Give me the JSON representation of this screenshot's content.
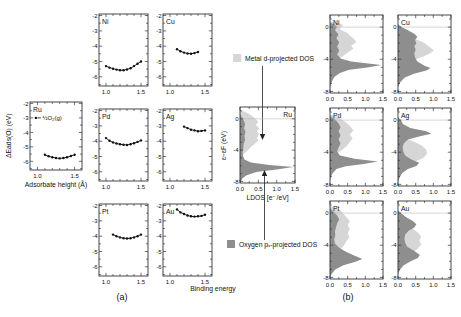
{
  "chart_data": {
    "curve_axis": {
      "xrange": [
        0.9,
        1.6
      ],
      "yrange": [
        -6.6,
        -1.9
      ],
      "xticks": [
        1.0,
        1.5
      ],
      "xminor": [
        1.1,
        1.2,
        1.3,
        1.4
      ],
      "yticks": [
        -2,
        -3,
        -4,
        -5,
        -6
      ],
      "yminor": [
        -2.5,
        -3.5,
        -4.5,
        -5.5,
        -6.5
      ],
      "grid": false
    },
    "dos_axis": {
      "xrange": [
        0,
        1.5
      ],
      "yrange": [
        -8.2,
        1.5
      ],
      "xticks": [
        0,
        0.5,
        1.0,
        1.5
      ],
      "xminor": [
        0.25,
        0.75,
        1.25
      ],
      "yticks": [
        0,
        -4,
        -8
      ],
      "yminor": [
        1,
        -1,
        -2,
        -3,
        -5,
        -6,
        -7
      ],
      "fermi_level": 0,
      "grid": false
    },
    "ru_curve": {
      "type": "line",
      "title": "Ru",
      "xlabel": "Adsorbate height (Å)",
      "ylabel": "ΔEads(O) (eV)",
      "annotation": {
        "text": "½O₂(g)",
        "x": 0.98,
        "y": -3.0
      },
      "x": [
        1.1,
        1.15,
        1.2,
        1.25,
        1.3,
        1.35,
        1.4,
        1.45,
        1.5
      ],
      "y": [
        -5.55,
        -5.65,
        -5.72,
        -5.77,
        -5.8,
        -5.77,
        -5.72,
        -5.63,
        -5.55
      ]
    },
    "panel_a_plots": [
      {
        "type": "line",
        "title": "Ni",
        "x": [
          1.0,
          1.05,
          1.1,
          1.15,
          1.2,
          1.25,
          1.3,
          1.35,
          1.4,
          1.45,
          1.5
        ],
        "y": [
          -5.3,
          -5.4,
          -5.47,
          -5.53,
          -5.57,
          -5.57,
          -5.52,
          -5.44,
          -5.3,
          -5.15,
          -5.0
        ]
      },
      {
        "type": "line",
        "title": "Cu",
        "x": [
          1.1,
          1.15,
          1.2,
          1.25,
          1.3,
          1.35,
          1.4
        ],
        "y": [
          -4.2,
          -4.33,
          -4.42,
          -4.48,
          -4.5,
          -4.45,
          -4.38
        ]
      },
      {
        "type": "line",
        "title": "Pd",
        "x": [
          1.0,
          1.05,
          1.1,
          1.15,
          1.2,
          1.25,
          1.3,
          1.35,
          1.4,
          1.45,
          1.5
        ],
        "y": [
          -3.8,
          -3.97,
          -4.08,
          -4.15,
          -4.2,
          -4.23,
          -4.25,
          -4.2,
          -4.13,
          -4.05,
          -3.95
        ]
      },
      {
        "type": "line",
        "title": "Ag",
        "x": [
          1.2,
          1.25,
          1.3,
          1.35,
          1.4,
          1.45,
          1.5
        ],
        "y": [
          -3.05,
          -3.15,
          -3.25,
          -3.3,
          -3.35,
          -3.33,
          -3.3
        ]
      },
      {
        "type": "line",
        "title": "Pt",
        "x": [
          1.1,
          1.15,
          1.2,
          1.25,
          1.3,
          1.35,
          1.4,
          1.45,
          1.5
        ],
        "y": [
          -3.9,
          -4.0,
          -4.08,
          -4.13,
          -4.15,
          -4.13,
          -4.08,
          -4.0,
          -3.9
        ]
      },
      {
        "type": "line",
        "title": "Au",
        "x": [
          1.1,
          1.15,
          1.2,
          1.25,
          1.3,
          1.35,
          1.4,
          1.45,
          1.5
        ],
        "y": [
          -2.25,
          -2.45,
          -2.55,
          -2.65,
          -2.7,
          -2.72,
          -2.7,
          -2.68,
          -2.6
        ]
      }
    ],
    "center_dos": {
      "type": "area",
      "title": "Ru",
      "xlabel": "LDOS [e⁻/eV]",
      "ylabel": "ε−εF (eV)",
      "metal_d": [
        [
          1.2,
          0
        ],
        [
          0.9,
          0.12
        ],
        [
          0.6,
          0.25
        ],
        [
          0.3,
          0.35
        ],
        [
          0,
          0.42
        ],
        [
          -0.4,
          0.5
        ],
        [
          -0.8,
          0.43
        ],
        [
          -1.2,
          0.53
        ],
        [
          -1.6,
          0.46
        ],
        [
          -2,
          0.52
        ],
        [
          -2.4,
          0.46
        ],
        [
          -2.8,
          0.5
        ],
        [
          -3.2,
          0.4
        ],
        [
          -3.6,
          0.3
        ],
        [
          -4,
          0.22
        ],
        [
          -4.4,
          0.12
        ],
        [
          -4.8,
          0.05
        ],
        [
          -5.2,
          0
        ]
      ],
      "oxygen_p": [
        [
          0.6,
          0
        ],
        [
          0.2,
          0.05
        ],
        [
          -0.2,
          0.1
        ],
        [
          -0.7,
          0.14
        ],
        [
          -1.2,
          0.11
        ],
        [
          -1.7,
          0.15
        ],
        [
          -2.2,
          0.12
        ],
        [
          -2.7,
          0.14
        ],
        [
          -3.2,
          0.1
        ],
        [
          -3.7,
          0.09
        ],
        [
          -4.2,
          0.07
        ],
        [
          -4.7,
          0.08
        ],
        [
          -5.2,
          0.12
        ],
        [
          -5.6,
          0.3
        ],
        [
          -5.9,
          0.8
        ],
        [
          -6.15,
          1.45
        ],
        [
          -6.45,
          1.05
        ],
        [
          -6.8,
          0.45
        ],
        [
          -7.2,
          0.18
        ],
        [
          -7.6,
          0.07
        ],
        [
          -8,
          0.02
        ],
        [
          -8.2,
          0
        ]
      ]
    },
    "panel_b_plots": [
      {
        "type": "area",
        "title": "Ni",
        "metal_d": [
          [
            0.7,
            0
          ],
          [
            0.45,
            0.28
          ],
          [
            0.2,
            0.38
          ],
          [
            0,
            0.32
          ],
          [
            -0.3,
            0.28
          ],
          [
            -0.7,
            0.48
          ],
          [
            -1.1,
            0.58
          ],
          [
            -1.5,
            0.68
          ],
          [
            -1.9,
            0.75
          ],
          [
            -2.3,
            0.6
          ],
          [
            -2.7,
            0.66
          ],
          [
            -3.1,
            0.52
          ],
          [
            -3.5,
            0.4
          ],
          [
            -3.9,
            0.26
          ],
          [
            -4.3,
            0.12
          ],
          [
            -4.7,
            0
          ]
        ],
        "oxygen_p": [
          [
            0.55,
            0
          ],
          [
            0.3,
            0.12
          ],
          [
            0,
            0.2
          ],
          [
            -0.4,
            0.14
          ],
          [
            -0.9,
            0.24
          ],
          [
            -1.4,
            0.18
          ],
          [
            -1.9,
            0.26
          ],
          [
            -2.4,
            0.2
          ],
          [
            -2.9,
            0.26
          ],
          [
            -3.4,
            0.2
          ],
          [
            -3.9,
            0.3
          ],
          [
            -4.3,
            0.6
          ],
          [
            -4.7,
            1.45
          ],
          [
            -5,
            1.1
          ],
          [
            -5.3,
            0.55
          ],
          [
            -5.7,
            0.28
          ],
          [
            -6.2,
            0.12
          ],
          [
            -6.8,
            0.05
          ],
          [
            -7.4,
            0.01
          ],
          [
            -7.8,
            0
          ]
        ]
      },
      {
        "type": "area",
        "title": "Cu",
        "metal_d": [
          [
            0.35,
            0
          ],
          [
            0,
            0.08
          ],
          [
            -0.5,
            0.12
          ],
          [
            -1,
            0.22
          ],
          [
            -1.5,
            0.5
          ],
          [
            -2,
            0.75
          ],
          [
            -2.5,
            0.9
          ],
          [
            -2.9,
            1.02
          ],
          [
            -3.3,
            0.9
          ],
          [
            -3.7,
            0.7
          ],
          [
            -4.1,
            0.45
          ],
          [
            -4.5,
            0.18
          ],
          [
            -4.9,
            0.05
          ],
          [
            -5.3,
            0
          ]
        ],
        "oxygen_p": [
          [
            0.35,
            0
          ],
          [
            0,
            0.1
          ],
          [
            -0.4,
            0.28
          ],
          [
            -0.8,
            0.45
          ],
          [
            -1.2,
            0.55
          ],
          [
            -1.6,
            0.48
          ],
          [
            -2,
            0.52
          ],
          [
            -2.4,
            0.46
          ],
          [
            -2.8,
            0.5
          ],
          [
            -3.3,
            0.46
          ],
          [
            -3.8,
            0.48
          ],
          [
            -4.3,
            0.55
          ],
          [
            -4.8,
            0.75
          ],
          [
            -5.1,
            0.92
          ],
          [
            -5.4,
            0.8
          ],
          [
            -5.8,
            0.45
          ],
          [
            -6.3,
            0.18
          ],
          [
            -6.9,
            0.06
          ],
          [
            -7.5,
            0
          ]
        ]
      },
      {
        "type": "area",
        "title": "Pd",
        "metal_d": [
          [
            0.7,
            0
          ],
          [
            0.4,
            0.2
          ],
          [
            0.1,
            0.32
          ],
          [
            -0.3,
            0.45
          ],
          [
            -0.8,
            0.58
          ],
          [
            -1.3,
            0.66
          ],
          [
            -1.8,
            0.56
          ],
          [
            -2.3,
            0.64
          ],
          [
            -2.8,
            0.55
          ],
          [
            -3.3,
            0.46
          ],
          [
            -3.8,
            0.32
          ],
          [
            -4.2,
            0.18
          ],
          [
            -4.6,
            0.06
          ],
          [
            -5,
            0
          ]
        ],
        "oxygen_p": [
          [
            0.5,
            0
          ],
          [
            0.1,
            0.14
          ],
          [
            -0.4,
            0.24
          ],
          [
            -0.9,
            0.3
          ],
          [
            -1.4,
            0.24
          ],
          [
            -1.9,
            0.3
          ],
          [
            -2.4,
            0.24
          ],
          [
            -2.9,
            0.3
          ],
          [
            -3.4,
            0.24
          ],
          [
            -3.9,
            0.2
          ],
          [
            -4.4,
            0.28
          ],
          [
            -4.8,
            0.7
          ],
          [
            -5.15,
            1.35
          ],
          [
            -5.45,
            0.95
          ],
          [
            -5.75,
            0.45
          ],
          [
            -6.1,
            0.18
          ],
          [
            -6.7,
            0.06
          ],
          [
            -7.3,
            0.01
          ],
          [
            -7.7,
            0
          ]
        ]
      },
      {
        "type": "area",
        "title": "Ag",
        "metal_d": [
          [
            0.25,
            0
          ],
          [
            0,
            0.05
          ],
          [
            -0.8,
            0.08
          ],
          [
            -1.6,
            0.12
          ],
          [
            -2.3,
            0.22
          ],
          [
            -2.8,
            0.5
          ],
          [
            -3.2,
            0.68
          ],
          [
            -3.7,
            0.8
          ],
          [
            -4.2,
            0.82
          ],
          [
            -4.7,
            0.72
          ],
          [
            -5.1,
            0.52
          ],
          [
            -5.5,
            0.25
          ],
          [
            -5.9,
            0.08
          ],
          [
            -6.3,
            0
          ]
        ],
        "oxygen_p": [
          [
            0.35,
            0
          ],
          [
            0,
            0.08
          ],
          [
            -0.5,
            0.14
          ],
          [
            -1,
            0.35
          ],
          [
            -1.4,
            0.8
          ],
          [
            -1.7,
            0.95
          ],
          [
            -2,
            0.65
          ],
          [
            -2.4,
            0.28
          ],
          [
            -2.9,
            0.16
          ],
          [
            -3.4,
            0.13
          ],
          [
            -3.9,
            0.15
          ],
          [
            -4.4,
            0.2
          ],
          [
            -4.9,
            0.38
          ],
          [
            -5.3,
            0.6
          ],
          [
            -5.7,
            0.52
          ],
          [
            -6.1,
            0.28
          ],
          [
            -6.6,
            0.12
          ],
          [
            -7.2,
            0.04
          ],
          [
            -7.7,
            0
          ]
        ]
      },
      {
        "type": "area",
        "title": "Pt",
        "metal_d": [
          [
            0.85,
            0
          ],
          [
            0.55,
            0.2
          ],
          [
            0.25,
            0.32
          ],
          [
            0,
            0.36
          ],
          [
            -0.5,
            0.46
          ],
          [
            -1,
            0.56
          ],
          [
            -1.5,
            0.5
          ],
          [
            -2,
            0.56
          ],
          [
            -2.5,
            0.5
          ],
          [
            -3,
            0.55
          ],
          [
            -3.5,
            0.46
          ],
          [
            -4,
            0.4
          ],
          [
            -4.5,
            0.3
          ],
          [
            -5,
            0.16
          ],
          [
            -5.5,
            0.05
          ],
          [
            -5.9,
            0
          ]
        ],
        "oxygen_p": [
          [
            0.6,
            0
          ],
          [
            0.2,
            0.1
          ],
          [
            -0.3,
            0.2
          ],
          [
            -0.8,
            0.26
          ],
          [
            -1.3,
            0.2
          ],
          [
            -1.8,
            0.17
          ],
          [
            -2.3,
            0.14
          ],
          [
            -2.8,
            0.15
          ],
          [
            -3.3,
            0.12
          ],
          [
            -3.8,
            0.14
          ],
          [
            -4.3,
            0.25
          ],
          [
            -4.8,
            0.45
          ],
          [
            -5.3,
            0.7
          ],
          [
            -5.7,
            0.92
          ],
          [
            -6.1,
            0.7
          ],
          [
            -6.5,
            0.38
          ],
          [
            -7,
            0.15
          ],
          [
            -7.6,
            0.04
          ],
          [
            -8,
            0
          ]
        ]
      },
      {
        "type": "area",
        "title": "Au",
        "metal_d": [
          [
            0.35,
            0
          ],
          [
            0,
            0.06
          ],
          [
            -0.6,
            0.12
          ],
          [
            -1.2,
            0.22
          ],
          [
            -1.8,
            0.38
          ],
          [
            -2.4,
            0.56
          ],
          [
            -2.9,
            0.66
          ],
          [
            -3.4,
            0.6
          ],
          [
            -3.9,
            0.66
          ],
          [
            -4.4,
            0.56
          ],
          [
            -4.9,
            0.42
          ],
          [
            -5.4,
            0.26
          ],
          [
            -5.9,
            0.1
          ],
          [
            -6.4,
            0
          ]
        ],
        "oxygen_p": [
          [
            0.35,
            0
          ],
          [
            0,
            0.08
          ],
          [
            -0.5,
            0.22
          ],
          [
            -1,
            0.42
          ],
          [
            -1.4,
            0.52
          ],
          [
            -1.8,
            0.46
          ],
          [
            -2.2,
            0.3
          ],
          [
            -2.7,
            0.2
          ],
          [
            -3.2,
            0.18
          ],
          [
            -3.7,
            0.2
          ],
          [
            -4.2,
            0.26
          ],
          [
            -4.7,
            0.46
          ],
          [
            -5.2,
            0.62
          ],
          [
            -5.6,
            0.56
          ],
          [
            -6,
            0.36
          ],
          [
            -6.5,
            0.16
          ],
          [
            -7,
            0.06
          ],
          [
            -7.6,
            0
          ]
        ]
      }
    ],
    "legend": {
      "metal": {
        "label": "Metal d-projected DOS",
        "color": "#d6d6d6"
      },
      "oxygen": {
        "label": "Oxygen pₓ-projected DOS",
        "color": "#8e8e8e"
      }
    },
    "shared_label": "Binding energy",
    "panel_labels": {
      "a": "(a)",
      "b": "(b)"
    }
  }
}
